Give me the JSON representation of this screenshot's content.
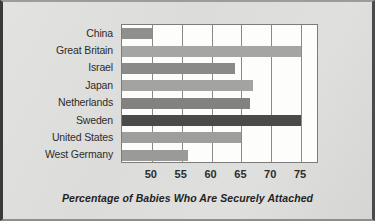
{
  "chart_data": {
    "type": "bar",
    "orientation": "horizontal",
    "title": "",
    "xlabel": "Percentage of Babies Who Are Securely Attached",
    "ylabel": "",
    "xlim": [
      45,
      78
    ],
    "xticks": [
      50,
      55,
      60,
      65,
      70,
      75
    ],
    "xtick_labels": [
      "50",
      "55",
      "60",
      "65",
      "70",
      "75"
    ],
    "grid": true,
    "grid_axis": "x",
    "legend": false,
    "categories": [
      "China",
      "Great Britain",
      "Israel",
      "Japan",
      "Netherlands",
      "Sweden",
      "United States",
      "West Germany"
    ],
    "values": [
      50,
      75,
      64,
      67,
      66.5,
      75,
      65,
      56
    ],
    "bar_colors": [
      "#8f8f8d",
      "#a5a5a3",
      "#8a8a88",
      "#a3a3a1",
      "#828280",
      "#4a4a48",
      "#9e9e9c",
      "#9a9a98"
    ]
  },
  "figure": {
    "background_color": "#dcdcda",
    "plot_background_color": "#fdfdfc",
    "axis_line_color": "#7c7c7a",
    "grid_color": "#8a8a88",
    "text_color": "#2c2c2c"
  }
}
